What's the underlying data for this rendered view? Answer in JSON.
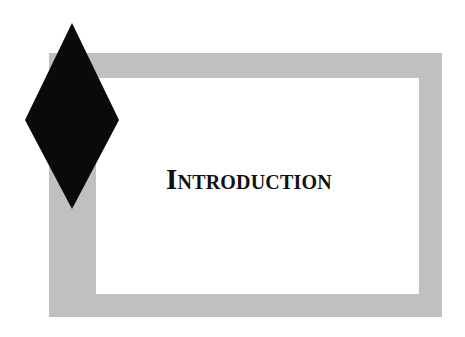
{
  "page": {
    "title": "Introduction"
  },
  "decor": {
    "frame_color": "#c0c0c0",
    "diamond_color": "#0a0a0a",
    "diamond_icon": "diamond-icon"
  }
}
